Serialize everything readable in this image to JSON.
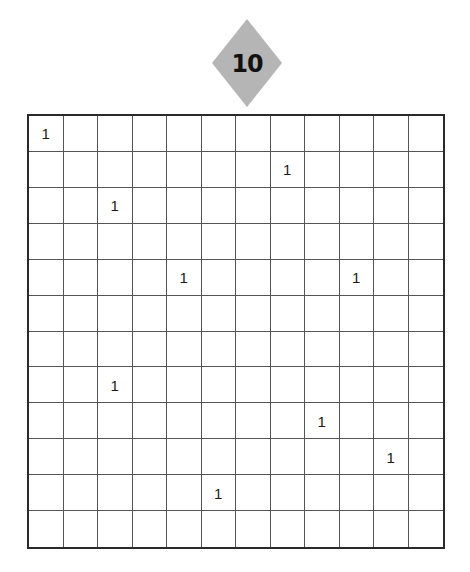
{
  "puzzle": {
    "number": "10",
    "badge_color": "#b5b5b5",
    "rows": 12,
    "cols": 12,
    "clues": [
      {
        "row": 0,
        "col": 0,
        "value": "1"
      },
      {
        "row": 1,
        "col": 7,
        "value": "1"
      },
      {
        "row": 2,
        "col": 2,
        "value": "1"
      },
      {
        "row": 4,
        "col": 4,
        "value": "1"
      },
      {
        "row": 4,
        "col": 9,
        "value": "1"
      },
      {
        "row": 7,
        "col": 2,
        "value": "1"
      },
      {
        "row": 8,
        "col": 8,
        "value": "1"
      },
      {
        "row": 9,
        "col": 10,
        "value": "1"
      },
      {
        "row": 10,
        "col": 5,
        "value": "1"
      }
    ]
  }
}
